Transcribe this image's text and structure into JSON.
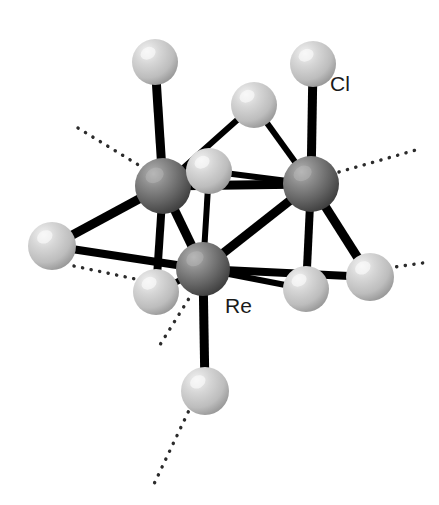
{
  "figure": {
    "background_color": "#ffffff",
    "width": 439,
    "height": 505
  },
  "colors": {
    "metal_dark": "#6b6b6b",
    "metal_dark_highlight": "#a9a9a9",
    "metal_dark_shadow": "#3a3a3a",
    "halide_light": "#c9c9c9",
    "halide_light_highlight": "#efefef",
    "halide_light_shadow": "#8e8e8e",
    "bond": "#000000",
    "dotted": "#2b2b2b",
    "label": "#1a1a1a"
  },
  "labels": [
    {
      "id": "label-cl",
      "text": "Cl",
      "x": 330,
      "y": 76,
      "target_atom": "cl-top-right"
    },
    {
      "id": "label-re",
      "text": "Re",
      "x": 225,
      "y": 298,
      "target_atom": "re-bottom"
    }
  ],
  "atoms": [
    {
      "id": "re-left",
      "element": "Re",
      "kind": "metal",
      "cx": 163,
      "cy": 186,
      "r": 28
    },
    {
      "id": "re-right",
      "element": "Re",
      "kind": "metal",
      "cx": 311,
      "cy": 184,
      "r": 28
    },
    {
      "id": "re-bottom",
      "element": "Re",
      "kind": "metal",
      "cx": 203,
      "cy": 269,
      "r": 27
    },
    {
      "id": "cl-top-left",
      "element": "Cl",
      "kind": "halide",
      "cx": 155,
      "cy": 62,
      "r": 23
    },
    {
      "id": "cl-top-right",
      "element": "Cl",
      "kind": "halide",
      "cx": 313,
      "cy": 64,
      "r": 23
    },
    {
      "id": "cl-top-bridge",
      "element": "Cl",
      "kind": "halide",
      "cx": 254,
      "cy": 105,
      "r": 23
    },
    {
      "id": "cl-center",
      "element": "Cl",
      "kind": "halide",
      "cx": 209,
      "cy": 171,
      "r": 23
    },
    {
      "id": "cl-left",
      "element": "Cl",
      "kind": "halide",
      "cx": 52,
      "cy": 246,
      "r": 24
    },
    {
      "id": "cl-lower-left",
      "element": "Cl",
      "kind": "halide",
      "cx": 156,
      "cy": 292,
      "r": 23
    },
    {
      "id": "cl-lower-mid",
      "element": "Cl",
      "kind": "halide",
      "cx": 306,
      "cy": 289,
      "r": 23
    },
    {
      "id": "cl-right",
      "element": "Cl",
      "kind": "halide",
      "cx": 370,
      "cy": 277,
      "r": 24
    },
    {
      "id": "cl-bottom",
      "element": "Cl",
      "kind": "halide",
      "cx": 205,
      "cy": 391,
      "r": 24
    }
  ],
  "bonds": [
    {
      "id": "bond-re-left-cl-top-left",
      "from": "re-left",
      "to": "cl-top-left",
      "width": 9
    },
    {
      "id": "bond-re-right-cl-top-right",
      "from": "re-right",
      "to": "cl-top-right",
      "width": 9
    },
    {
      "id": "bond-re-bottom-cl-bottom",
      "from": "re-bottom",
      "to": "cl-bottom",
      "width": 9
    },
    {
      "id": "bond-re-left-re-right",
      "from": "re-left",
      "to": "re-right",
      "width": 9
    },
    {
      "id": "bond-re-left-re-bottom",
      "from": "re-left",
      "to": "re-bottom",
      "width": 9
    },
    {
      "id": "bond-re-right-re-bottom",
      "from": "re-right",
      "to": "re-bottom",
      "width": 9
    },
    {
      "id": "bond-re-left-cl-top-bridge",
      "from": "re-left",
      "to": "cl-top-bridge",
      "width": 6
    },
    {
      "id": "bond-re-right-cl-top-bridge",
      "from": "re-right",
      "to": "cl-top-bridge",
      "width": 6
    },
    {
      "id": "bond-re-left-cl-center",
      "from": "re-left",
      "to": "cl-center",
      "width": 6
    },
    {
      "id": "bond-re-right-cl-center",
      "from": "re-right",
      "to": "cl-center",
      "width": 6
    },
    {
      "id": "bond-re-bottom-cl-center",
      "from": "re-bottom",
      "to": "cl-center",
      "width": 6
    },
    {
      "id": "bond-re-left-cl-left",
      "from": "re-left",
      "to": "cl-left",
      "width": 9
    },
    {
      "id": "bond-re-bottom-cl-left",
      "from": "re-bottom",
      "to": "cl-left",
      "width": 8
    },
    {
      "id": "bond-re-left-cl-lower-left",
      "from": "re-left",
      "to": "cl-lower-left",
      "width": 8
    },
    {
      "id": "bond-re-bottom-cl-lower-left",
      "from": "re-bottom",
      "to": "cl-lower-left",
      "width": 6
    },
    {
      "id": "bond-re-right-cl-lower-mid",
      "from": "re-right",
      "to": "cl-lower-mid",
      "width": 8
    },
    {
      "id": "bond-re-bottom-cl-lower-mid",
      "from": "re-bottom",
      "to": "cl-lower-mid",
      "width": 6
    },
    {
      "id": "bond-re-right-cl-right",
      "from": "re-right",
      "to": "cl-right",
      "width": 9
    },
    {
      "id": "bond-re-bottom-cl-right",
      "from": "re-bottom",
      "to": "cl-right",
      "width": 8
    }
  ],
  "dotted_bonds": [
    {
      "id": "dotted-upper-left",
      "x1": 78,
      "y1": 128,
      "x2": 150,
      "y2": 172
    },
    {
      "id": "dotted-upper-right",
      "x1": 339,
      "y1": 172,
      "x2": 416,
      "y2": 150
    },
    {
      "id": "dotted-right",
      "x1": 388,
      "y1": 268,
      "x2": 430,
      "y2": 262
    },
    {
      "id": "dotted-left-low",
      "x1": 74,
      "y1": 266,
      "x2": 140,
      "y2": 280
    },
    {
      "id": "dotted-bottom-mid",
      "x1": 193,
      "y1": 292,
      "x2": 158,
      "y2": 348
    },
    {
      "id": "dotted-bottom",
      "x1": 192,
      "y1": 404,
      "x2": 154,
      "y2": 484
    }
  ]
}
